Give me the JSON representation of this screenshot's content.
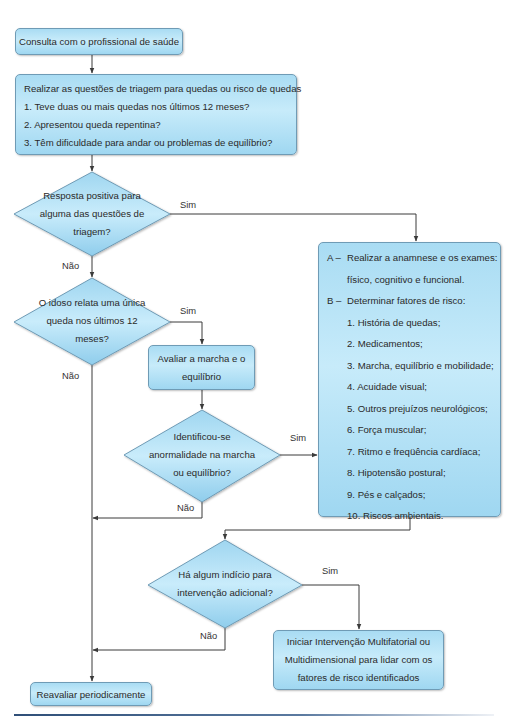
{
  "flowchart": {
    "start": {
      "label": "Consulta com o profissional de saúde"
    },
    "screening": {
      "title": "Realizar as questões de triagem para quedas ou risco de quedas",
      "questions": [
        "1. Teve duas ou mais quedas nos últimos 12 meses?",
        "2. Apresentou queda repentina?",
        "3. Têm dificuldade para andar ou problemas de equilíbrio?"
      ]
    },
    "decision1": {
      "lines": [
        "Resposta positiva para",
        "alguma das questões de",
        "triagem?"
      ],
      "yes": "Sim",
      "no": "Não"
    },
    "decision2": {
      "lines": [
        "O idoso relata uma única",
        "queda nos últimos 12",
        "meses?"
      ],
      "yes": "Sim",
      "no": "Não"
    },
    "gait_box": {
      "lines": [
        "Avaliar a marcha e o",
        "equilíbrio"
      ]
    },
    "decision3": {
      "lines": [
        "Identificou-se",
        "anormalidade na marcha",
        "ou equilíbrio?"
      ],
      "yes": "Sim",
      "no": "Não"
    },
    "assessment": {
      "a_marker": "A –",
      "a_lines": [
        "Realizar a anamnese e os exames:",
        "físico, cognitivo e funcional."
      ],
      "b_marker": "B –",
      "b_title": "Determinar fatores de risco:",
      "risk_factors": [
        "1. História de quedas;",
        "2. Medicamentos;",
        "3. Marcha, equilíbrio e mobilidade;",
        "4. Acuidade visual;",
        "5. Outros prejuízos neurológicos;",
        "6. Força muscular;",
        "7. Ritmo e freqüência cardíaca;",
        "8. Hipotensão postural;",
        "9. Pés e calçados;",
        "10. Riscos ambientais."
      ]
    },
    "decision4": {
      "lines": [
        "Há algum indício para",
        "intervenção adicional?"
      ],
      "yes": "Sim",
      "no": "Não"
    },
    "intervention": {
      "lines": [
        "Iniciar Intervenção Multifatorial ou",
        "Multidimensional para lidar com os",
        "fatores de risco identificados"
      ]
    },
    "reassess": {
      "label": "Reavaliar periodicamente"
    }
  },
  "colors": {
    "box_fill": "#b8e3f7",
    "box_border": "#6f9bb5",
    "line": "#3a3a3a",
    "rule": "#2f4f78"
  }
}
